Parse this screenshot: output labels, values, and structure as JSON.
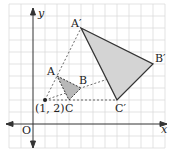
{
  "diagram": {
    "axes": {
      "x_label": "x",
      "y_label": "y",
      "origin_label": "O"
    },
    "center": {
      "label": "(1, 2)",
      "x": 1,
      "y": 2
    },
    "scale_factor": 3,
    "triangle": {
      "A": {
        "label": "A",
        "x": 2,
        "y": 4
      },
      "B": {
        "label": "B",
        "x": 4,
        "y": 3
      },
      "C": {
        "label": "C",
        "x": 3,
        "y": 2
      }
    },
    "image": {
      "A": {
        "label": "A′",
        "x": 4,
        "y": 8
      },
      "B": {
        "label": "B′",
        "x": 10,
        "y": 5
      },
      "C": {
        "label": "C′",
        "x": 7,
        "y": 2
      }
    },
    "colors": {
      "grid": "#d8d8d8",
      "fill": "#d4d4d4",
      "small_fill": "#b8b8b8",
      "line": "#333333"
    }
  }
}
